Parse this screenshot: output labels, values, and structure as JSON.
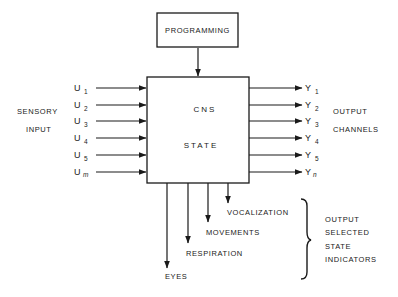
{
  "diagram": {
    "programming_label": "PROGRAMMING",
    "cns_line1": "CNS",
    "cns_line2": "STATE",
    "sensory_line1": "SENSORY",
    "sensory_line2": "INPUT",
    "output_channels_line1": "OUTPUT",
    "output_channels_line2": "CHANNELS",
    "inputs": [
      {
        "symbol": "U",
        "sub": "1"
      },
      {
        "symbol": "U",
        "sub": "2"
      },
      {
        "symbol": "U",
        "sub": "3"
      },
      {
        "symbol": "U",
        "sub": "4"
      },
      {
        "symbol": "U",
        "sub": "5"
      },
      {
        "symbol": "U",
        "sub": "m"
      }
    ],
    "outputs": [
      {
        "symbol": "Y",
        "sub": "1"
      },
      {
        "symbol": "Y",
        "sub": "2"
      },
      {
        "symbol": "Y",
        "sub": "3"
      },
      {
        "symbol": "Y",
        "sub": "4"
      },
      {
        "symbol": "Y",
        "sub": "5"
      },
      {
        "symbol": "Y",
        "sub": "n"
      }
    ],
    "indicators": [
      "VOCALIZATION",
      "MOVEMENTS",
      "RESPIRATION",
      "EYES"
    ],
    "indicator_group": [
      "OUTPUT",
      "SELECTED",
      "STATE",
      "INDICATORS"
    ],
    "line_color": "#1a1a1a"
  }
}
